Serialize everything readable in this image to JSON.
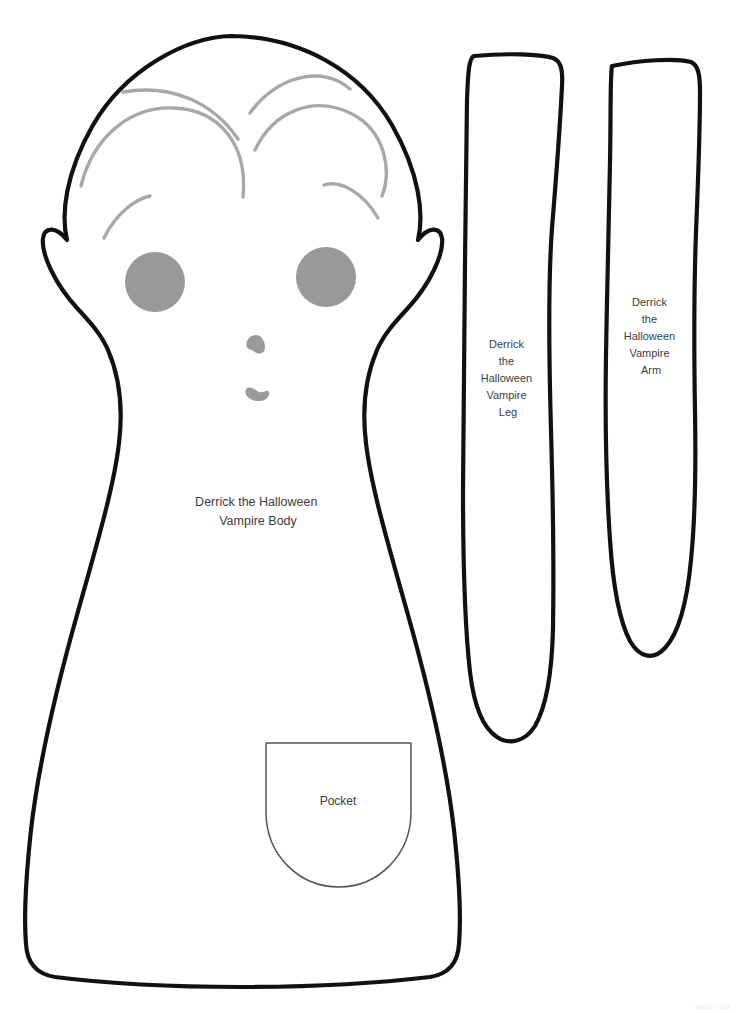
{
  "document": {
    "title": "Derrick the Halloween Vampire Sewing Pattern",
    "background_color": "#ffffff",
    "width": 737,
    "height": 1013
  },
  "colors": {
    "cut_line": "#111111",
    "fold_line": "#555555",
    "hair_line": "#a8a8a8",
    "eye_fill": "#999999",
    "feature_fill": "#9a9a9a",
    "label_text": "#3c3c3c",
    "page_background": "#ffffff",
    "watermark": "#f0f0f0"
  },
  "pieces": [
    {
      "id": "body",
      "name": "Derrick the Halloween Vampire Body",
      "label_lines": [
        "Derrick the Halloween",
        "Vampire Body"
      ],
      "label_x": 258,
      "label_y": 503,
      "line_height": 19,
      "features": [
        "head",
        "pointed-vampire-ears",
        "widows-peak-hair",
        "two-eyes",
        "nose",
        "mouth",
        "tapered-torso",
        "pocket"
      ]
    },
    {
      "id": "leg",
      "name": "Derrick the Halloween Vampire Leg",
      "label_lines": [
        "Derrick",
        "the",
        "Halloween",
        "Vampire",
        "Leg"
      ],
      "label_x": 508,
      "label_y": 345,
      "line_height": 17
    },
    {
      "id": "arm",
      "name": "Derrick the Halloween Vampire Arm",
      "label_lines": [
        "Derrick",
        "the",
        "Halloween",
        "Vampire",
        "Arm"
      ],
      "label_x": 651,
      "label_y": 303,
      "line_height": 17
    },
    {
      "id": "pocket",
      "name": "Pocket",
      "label_lines": [
        "Pocket"
      ],
      "label_x": 338,
      "label_y": 802,
      "line_height": 16
    }
  ],
  "geometry": {
    "body_outline": "M 232,36 C 300,37 360,70 392,125 C 420,174 424,215 418,240 C 428,227 440,226 442,238 C 444,254 430,284 408,308 C 395,322 384,334 377,350 C 365,378 362,410 366,443 C 371,487 389,547 408,615 C 428,686 446,760 454,830 C 459,876 461,920 459,944 C 458,962 449,974 430,977 C 370,984 300,987 241,987 C 180,987 110,984 55,977 C 36,974 27,962 26,944 C 24,920 26,876 31,830 C 39,760 57,686 77,615 C 96,547 114,487 119,443 C 123,410 120,378 108,350 C 101,334 90,322 77,308 C 55,284 41,254 43,238 C 45,226 57,227 67,240 C 61,215 65,174 93,125 C 125,70 185,37 232,36 Z",
    "left_ear": "M 43,238 C 45,226 57,227 67,240 C 78,254 92,278 108,302",
    "right_ear": "M 442,238 C 440,226 428,227 418,240 C 407,254 393,278 377,302",
    "hair_strands": [
      "M 123,92 C 170,84 212,101 238,139",
      "M 250,113 C 275,77 322,64 350,89",
      "M 81,186 C 93,137 130,106 174,108 C 220,110 248,145 243,197",
      "M 255,150 C 274,110 315,95 352,114 C 385,131 392,170 382,196",
      "M 104,238 C 116,213 136,199 150,196",
      "M 324,185 C 340,180 363,192 378,218"
    ],
    "eyes": [
      {
        "cx": 155,
        "cy": 282,
        "r": 30
      },
      {
        "cx": 326,
        "cy": 277,
        "r": 30
      },
      {
        "rx": 30,
        "ry": 30
      }
    ],
    "nose": "M 247,341 C 250,334 258,333 262,338 C 266,344 266,351 262,353 C 257,355 254,351 252,350 C 248,349 245,347 247,341 Z",
    "mouth": "M 246,389 C 250,385 255,390 259,392 C 263,393 266,390 268,391 C 271,393 268,400 261,401 C 252,402 243,396 246,389 Z",
    "pocket_outline": "M 266,743 L 411,743 L 411,812 C 411,855 378,887 339,887 C 299,887 266,855 266,812 Z",
    "leg_outline": "M 474,56 C 506,53 540,54 553,58 C 561,61 563,70 562,86 C 560,126 556,180 552,228 C 548,282 549,360 551,430 C 553,500 554,568 553,628 C 552,672 546,707 535,726 C 525,742 509,745 497,737 C 483,728 474,706 470,672 C 465,628 463,560 463,490 C 463,410 464,330 465,262 C 466,196 466,140 467,100 C 468,72 469,58 474,56 Z",
    "arm_outline": "M 612,66 C 640,60 676,58 691,62 C 698,65 700,74 700,92 C 700,132 698,184 696,232 C 694,286 694,352 695,412 C 696,468 695,520 691,560 C 687,602 678,634 665,648 C 653,661 639,657 630,641 C 620,622 613,586 610,540 C 606,482 605,418 606,356 C 607,290 609,222 610,162 C 611,112 610,76 612,66 Z"
  },
  "watermark": {
    "visible": true,
    "text": "watermark"
  }
}
